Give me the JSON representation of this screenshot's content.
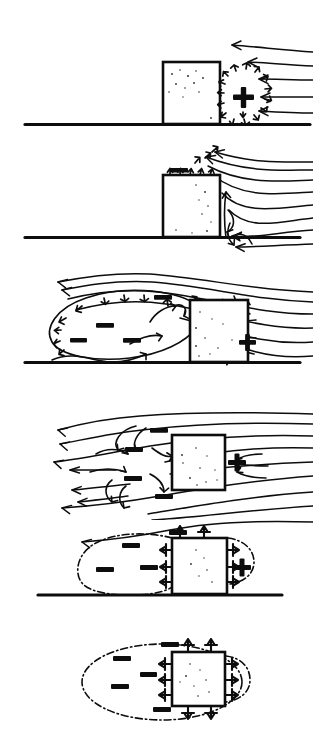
{
  "figure": {
    "flow_direction": "right-to-left",
    "panel_count": 6,
    "background_color": "#ffffff",
    "ink_color": "#0d0d0d"
  },
  "symbols": {
    "positive_label": "+",
    "negative_label": "–",
    "positive_meaning": "positive pressure (windward stagnation)",
    "negative_meaning": "negative pressure (suction / wake)"
  },
  "panels": [
    {
      "index": 1,
      "name": "panel-stagnation",
      "caption": "Oncoming wind strikes the windward face creating positive pressure",
      "ground": true,
      "box": {
        "x": 163,
        "y": 62,
        "w": 57,
        "h": 62,
        "stippled": true
      },
      "signs": [
        {
          "type": "+",
          "x": 243,
          "y": 98
        }
      ],
      "streamline_count": 5,
      "burst_arrows": 20
    },
    {
      "index": 2,
      "name": "panel-separation",
      "caption": "Flow separates at the leading edge; suction forms above the roof",
      "ground": true,
      "box": {
        "x": 163,
        "y": 175,
        "w": 57,
        "h": 62,
        "stippled": true
      },
      "signs": [
        {
          "type": "–",
          "x": 180,
          "y": 172
        }
      ],
      "streamline_count": 6,
      "vortex_count": 2
    },
    {
      "index": 3,
      "name": "panel-wake-bubble",
      "caption": "A large separation bubble of negative pressure forms leeward",
      "ground": true,
      "box": {
        "x": 190,
        "y": 300,
        "w": 58,
        "h": 62,
        "stippled": true
      },
      "signs": [
        {
          "type": "–",
          "x": 163,
          "y": 297
        },
        {
          "type": "–",
          "x": 104,
          "y": 325
        },
        {
          "type": "–",
          "x": 78,
          "y": 340
        },
        {
          "type": "–",
          "x": 131,
          "y": 340
        },
        {
          "type": "+",
          "x": 236,
          "y": 342
        }
      ],
      "streamline_count": 5,
      "bubble": true
    },
    {
      "index": 4,
      "name": "panel-free-stream",
      "caption": "Body clear of the ground: wake wraps symmetrically around it",
      "ground": false,
      "box": {
        "x": 172,
        "y": 435,
        "w": 53,
        "h": 55,
        "stippled": true
      },
      "signs": [
        {
          "type": "–",
          "x": 159,
          "y": 430
        },
        {
          "type": "–",
          "x": 134,
          "y": 449
        },
        {
          "type": "–",
          "x": 133,
          "y": 478
        },
        {
          "type": "–",
          "x": 164,
          "y": 496
        },
        {
          "type": "+",
          "x": 236,
          "y": 463
        }
      ],
      "streamline_count": 8
    },
    {
      "index": 5,
      "name": "panel-pressure-envelope-grounded",
      "caption": "Resulting pressure envelope: suction lifts roof and rear wall",
      "ground": true,
      "box": {
        "x": 172,
        "y": 538,
        "w": 55,
        "h": 56,
        "stippled": true
      },
      "signs": [
        {
          "type": "–",
          "x": 178,
          "y": 532
        },
        {
          "type": "–",
          "x": 131,
          "y": 545
        },
        {
          "type": "–",
          "x": 105,
          "y": 569
        },
        {
          "type": "–",
          "x": 149,
          "y": 567
        },
        {
          "type": "+",
          "x": 241,
          "y": 569
        }
      ],
      "envelope": "dash-dot bubble",
      "force_arrows": 10
    },
    {
      "index": 6,
      "name": "panel-pressure-envelope-free",
      "caption": "Free body: suction acts outward on every face",
      "ground": false,
      "box": {
        "x": 172,
        "y": 652,
        "w": 53,
        "h": 54,
        "stippled": true
      },
      "signs": [
        {
          "type": "–",
          "x": 171,
          "y": 645
        },
        {
          "type": "–",
          "x": 122,
          "y": 657
        },
        {
          "type": "–",
          "x": 149,
          "y": 672
        },
        {
          "type": "–",
          "x": 120,
          "y": 685
        },
        {
          "type": "–",
          "x": 162,
          "y": 708
        }
      ],
      "envelope": "dash-dot ellipse",
      "force_arrows": 12
    }
  ]
}
